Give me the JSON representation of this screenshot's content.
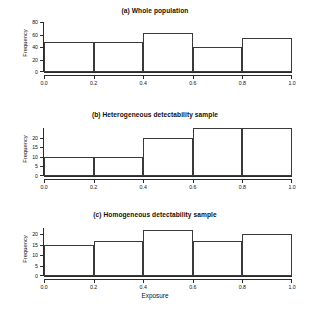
{
  "figure": {
    "x_axis_title": "Exposure",
    "y_axis_title": "Frequency"
  },
  "panels": [
    {
      "id": "a",
      "title": "(a) Whole population",
      "yticks": [
        "0",
        "20",
        "40",
        "60",
        "80"
      ],
      "xticks": [
        "0.0",
        "0.2",
        "0.4",
        "0.6",
        "0.8",
        "1.0"
      ]
    },
    {
      "id": "b",
      "title": "(b) Heterogeneous detectability sample",
      "yticks": [
        "0",
        "5",
        "10",
        "15",
        "20"
      ],
      "xticks": [
        "0.0",
        "0.2",
        "0.4",
        "0.6",
        "0.8",
        "1.0"
      ]
    },
    {
      "id": "c",
      "title": "(c) Homogeneous detectability sample",
      "yticks": [
        "0",
        "5",
        "10",
        "15",
        "20"
      ],
      "xticks": [
        "0.0",
        "0.2",
        "0.4",
        "0.6",
        "0.8",
        "1.0"
      ]
    }
  ],
  "chart_data": [
    {
      "type": "bar",
      "title": "(a) Whole population",
      "xlabel": "",
      "ylabel": "Frequency",
      "bin_edges": [
        0.0,
        0.2,
        0.4,
        0.6,
        0.8,
        1.0
      ],
      "categories": [
        "0.0-0.2",
        "0.2-0.4",
        "0.4-0.6",
        "0.6-0.8",
        "0.8-1.0"
      ],
      "values": [
        48,
        48,
        62,
        40,
        55
      ],
      "xlim": [
        0.0,
        1.0
      ],
      "ylim": [
        0,
        80
      ],
      "ytick_values": [
        0,
        20,
        40,
        60,
        80
      ],
      "xtick_values": [
        0.0,
        0.2,
        0.4,
        0.6,
        0.8,
        1.0
      ],
      "grid": false,
      "legend": false,
      "bar_fill": "none",
      "bar_edge_color": "#3a3a3a"
    },
    {
      "type": "bar",
      "title": "(b) Heterogeneous detectability sample",
      "xlabel": "",
      "ylabel": "Frequency",
      "bin_edges": [
        0.0,
        0.2,
        0.4,
        0.6,
        0.8,
        1.0
      ],
      "categories": [
        "0.0-0.2",
        "0.2-0.4",
        "0.4-0.6",
        "0.6-0.8",
        "0.8-1.0"
      ],
      "values": [
        10,
        10,
        20,
        25,
        25
      ],
      "xlim": [
        0.0,
        1.0
      ],
      "ylim": [
        0,
        25
      ],
      "ytick_values": [
        0,
        5,
        10,
        15,
        20
      ],
      "xtick_values": [
        0.0,
        0.2,
        0.4,
        0.6,
        0.8,
        1.0
      ],
      "grid": false,
      "legend": false,
      "bar_fill": "none",
      "bar_edge_color": "#3a3a3a"
    },
    {
      "type": "bar",
      "title": "(c) Homogeneous detectability sample",
      "xlabel": "Exposure",
      "ylabel": "Frequency",
      "bin_edges": [
        0.0,
        0.2,
        0.4,
        0.6,
        0.8,
        1.0
      ],
      "categories": [
        "0.0-0.2",
        "0.2-0.4",
        "0.4-0.6",
        "0.6-0.8",
        "0.8-1.0"
      ],
      "values": [
        15,
        17,
        22,
        17,
        20
      ],
      "xlim": [
        0.0,
        1.0
      ],
      "ylim": [
        0,
        23
      ],
      "ytick_values": [
        0,
        5,
        10,
        15,
        20
      ],
      "xtick_values": [
        0.0,
        0.2,
        0.4,
        0.6,
        0.8,
        1.0
      ],
      "grid": false,
      "legend": false,
      "bar_fill": "none",
      "bar_edge_color": "#3a3a3a"
    }
  ]
}
